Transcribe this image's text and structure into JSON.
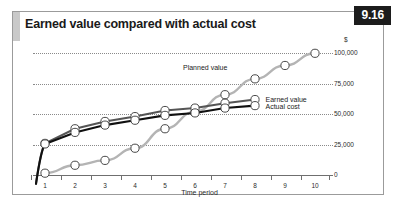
{
  "figure": {
    "number": "9.16",
    "title": "Earned value compared with actual cost"
  },
  "chart_data": {
    "type": "line",
    "title": "Earned value compared with actual cost",
    "xlabel": "Time period",
    "ylabel": "$",
    "x": [
      1,
      2,
      3,
      4,
      5,
      6,
      7,
      8,
      9,
      10
    ],
    "xlim": [
      0.6,
      10.6
    ],
    "ylim": [
      0,
      106000
    ],
    "yticks": [
      0,
      25000,
      50000,
      75000,
      100000
    ],
    "ytick_labels": [
      "0",
      "25,000",
      "50,000",
      "75,000",
      "100,000"
    ],
    "xtick_labels": [
      "1",
      "2",
      "3",
      "4",
      "5",
      "6",
      "7",
      "8",
      "9",
      "10"
    ],
    "grid": true,
    "legend": "inline-annotations",
    "series": [
      {
        "name": "Planned value",
        "color": "#b4b4b4",
        "marker": "open-circle",
        "x": [
          1,
          2,
          3,
          4,
          5,
          6,
          7,
          8,
          9,
          10
        ],
        "values": [
          1500,
          8000,
          12000,
          22000,
          38000,
          52000,
          66000,
          79000,
          90000,
          100000
        ]
      },
      {
        "name": "Earned value",
        "color": "#555555",
        "marker": "open-circle",
        "x": [
          1,
          2,
          3,
          4,
          5,
          6,
          7,
          8
        ],
        "values": [
          26000,
          38000,
          44000,
          48000,
          53000,
          55000,
          59000,
          62000
        ]
      },
      {
        "name": "Actual cost",
        "color": "#101010",
        "marker": "open-circle",
        "x": [
          1,
          2,
          3,
          4,
          5,
          6,
          7,
          8
        ],
        "values": [
          25500,
          35000,
          41000,
          45000,
          49000,
          51000,
          55000,
          57000
        ]
      }
    ],
    "annotations": [
      {
        "text": "Planned value",
        "x": 7.0,
        "y": 88000
      },
      {
        "text": "Earned value",
        "x": 8.35,
        "y": 62000
      },
      {
        "text": "Actual cost",
        "x": 8.35,
        "y": 56000
      }
    ]
  }
}
